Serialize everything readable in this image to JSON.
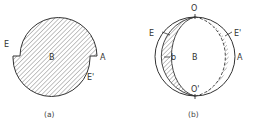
{
  "figure_a": {
    "caption": "(a)",
    "labels": {
      "E": "E",
      "B": "B",
      "A": "A",
      "E_prime": "E'"
    }
  },
  "figure_b": {
    "caption": "(b)",
    "labels": {
      "O": "O",
      "E": "E",
      "E_prime": "E'",
      "b": "b",
      "B": "B",
      "A": "A",
      "O_prime": "O'"
    }
  },
  "colors": {
    "stroke": "#333333",
    "hatch": "#555555",
    "background": "#ffffff"
  }
}
